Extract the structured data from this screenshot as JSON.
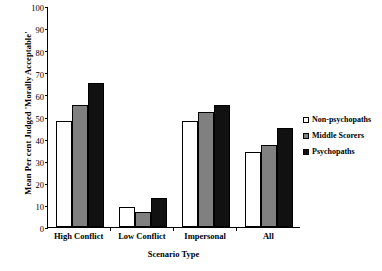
{
  "chart_data": {
    "type": "bar",
    "title": "",
    "xlabel": "Scenario Type",
    "ylabel": "Mean Per cent Judged 'Morally Acceptable'",
    "categories": [
      "High Conflict",
      "Low Conflict",
      "Impersonal",
      "All"
    ],
    "series": [
      {
        "name": "Non-psychopaths",
        "color": "#ffffff",
        "values": [
          48,
          9,
          48,
          34
        ]
      },
      {
        "name": "Middle Scorers",
        "color": "#808080",
        "values": [
          55,
          7,
          52,
          37
        ]
      },
      {
        "name": "Psychopaths",
        "color": "#111111",
        "values": [
          65,
          13,
          55,
          45
        ]
      }
    ],
    "ylim": [
      0,
      100
    ],
    "yticks": [
      100,
      90,
      80,
      70,
      60,
      50,
      40,
      30,
      20,
      10,
      0
    ],
    "grid": false,
    "legend_position": "right"
  }
}
